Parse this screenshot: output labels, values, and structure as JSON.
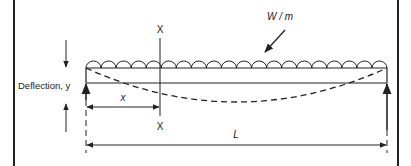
{
  "diagram": {
    "type": "simply-supported beam with uniformly distributed load",
    "colors": {
      "line": "#222222",
      "background": "#ffffff"
    },
    "labels": {
      "load": "W / m",
      "section_top": "X",
      "section_bottom": "X",
      "deflection": "Deflection, y",
      "distance": "x",
      "span": "L"
    }
  }
}
